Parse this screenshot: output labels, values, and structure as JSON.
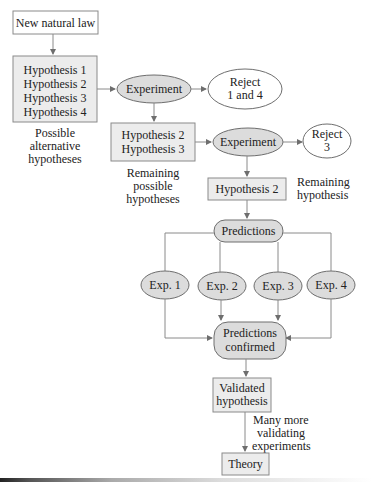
{
  "diagram": {
    "new_law": "New natural law",
    "hypotheses_all": [
      "Hypothesis 1",
      "Hypothesis 2",
      "Hypothesis 3",
      "Hypothesis 4"
    ],
    "possible_caption": [
      "Possible",
      "alternative",
      "hypotheses"
    ],
    "experiment1": "Experiment",
    "reject1": [
      "Reject",
      "1 and 4"
    ],
    "hypotheses_remaining": [
      "Hypothesis 2",
      "Hypothesis 3"
    ],
    "remaining_caption": [
      "Remaining",
      "possible",
      "hypotheses"
    ],
    "experiment2": "Experiment",
    "reject2": [
      "Reject",
      "3"
    ],
    "hypothesis_final": "Hypothesis 2",
    "remaining_hyp_caption": [
      "Remaining",
      "hypothesis"
    ],
    "predictions": "Predictions",
    "experiments": [
      "Exp. 1",
      "Exp. 2",
      "Exp. 3",
      "Exp. 4"
    ],
    "predictions_confirmed": [
      "Predictions",
      "confirmed"
    ],
    "validated": [
      "Validated",
      "hypothesis"
    ],
    "many_more": [
      "Many more",
      "validating",
      "experiments"
    ],
    "theory": "Theory"
  }
}
